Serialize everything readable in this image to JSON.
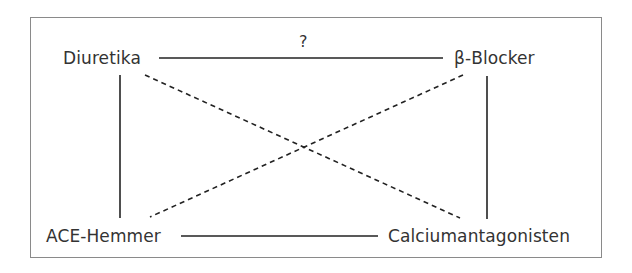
{
  "diagram": {
    "nodes": {
      "top_left": "Diuretika",
      "top_right": "β-Blocker",
      "bottom_left": "ACE-Hemmer",
      "bottom_right": "Calciumantagonisten"
    },
    "edges": [
      {
        "from": "Diuretika",
        "to": "β-Blocker",
        "style": "solid",
        "label": "?"
      },
      {
        "from": "Diuretika",
        "to": "ACE-Hemmer",
        "style": "solid"
      },
      {
        "from": "β-Blocker",
        "to": "Calciumantagonisten",
        "style": "solid"
      },
      {
        "from": "ACE-Hemmer",
        "to": "Calciumantagonisten",
        "style": "solid"
      },
      {
        "from": "Diuretika",
        "to": "Calciumantagonisten",
        "style": "dashed"
      },
      {
        "from": "β-Blocker",
        "to": "ACE-Hemmer",
        "style": "dashed"
      }
    ],
    "top_edge_label": "?",
    "colors": {
      "line": "#222222",
      "text": "#333333",
      "frame": "#8a8a8a"
    }
  }
}
